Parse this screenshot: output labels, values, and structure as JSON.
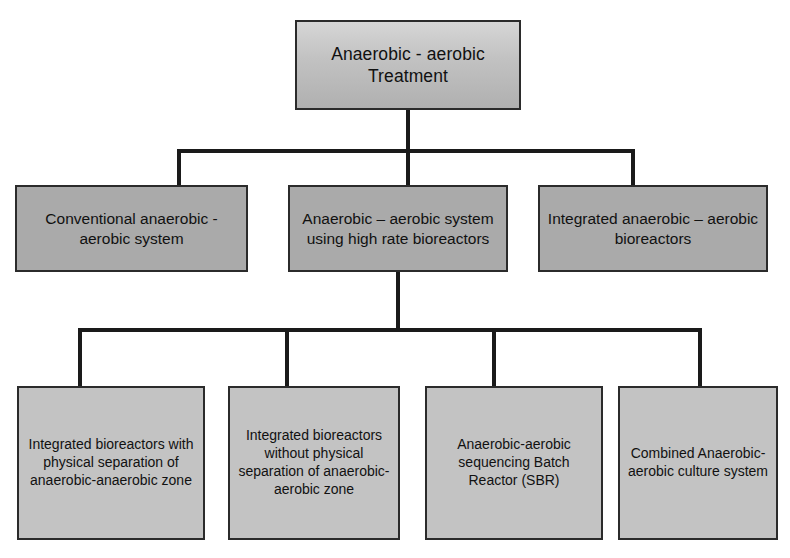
{
  "diagram": {
    "type": "hierarchy-tree",
    "colors": {
      "root_fill": "#c2c2c2",
      "level1_fill": "#aaaaaa",
      "level2_fill": "#c3c3c3",
      "border": "#2b2b2b",
      "connector": "#1a1a1a",
      "background": "#ffffff",
      "text": "#111111"
    },
    "root": {
      "label": "Anaerobic - aerobic Treatment"
    },
    "level1": [
      {
        "label": "Conventional anaerobic - aerobic system"
      },
      {
        "label": "Anaerobic – aerobic system using high rate bioreactors"
      },
      {
        "label": "Integrated anaerobic – aerobic bioreactors"
      }
    ],
    "level2": [
      {
        "label": "Integrated bioreactors with physical separation of anaerobic-anaerobic zone"
      },
      {
        "label": "Integrated bioreactors without physical separation of anaerobic-aerobic zone"
      },
      {
        "label": "Anaerobic-aerobic sequencing Batch Reactor (SBR)"
      },
      {
        "label": "Combined Anaerobic-aerobic culture system"
      }
    ]
  }
}
